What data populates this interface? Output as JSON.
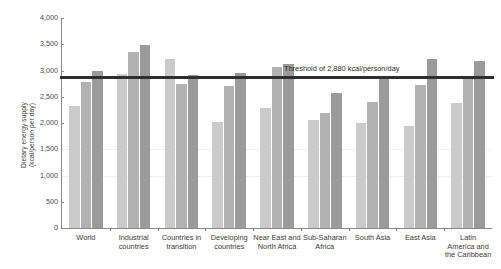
{
  "chart_data": {
    "type": "bar",
    "title": "",
    "xlabel": "",
    "ylabel_lines": [
      "Dietary energy supply",
      "(kcal/person per day)"
    ],
    "ylim": [
      0,
      4000
    ],
    "ytick_values": [
      0,
      500,
      1000,
      1500,
      2000,
      2500,
      3000,
      3500,
      4000
    ],
    "ytick_labels": [
      "0",
      "500",
      "1,000",
      "1,500",
      "2,000",
      "2,500",
      "3,000",
      "3,500",
      "4,000"
    ],
    "grid": false,
    "legend": "none",
    "categories": [
      "World",
      "Industrial countries",
      "Countries in transition",
      "Developing countries",
      "Near East and North Africa",
      "Sub-Saharan Africa",
      "South Asia",
      "East Asia",
      "Latin America and the Caribbean"
    ],
    "category_label_lines": [
      [
        "World"
      ],
      [
        "Industrial",
        "countries"
      ],
      [
        "Countries in",
        "transition"
      ],
      [
        "Developing",
        "countries"
      ],
      [
        "Near East and",
        "North Africa"
      ],
      [
        "Sub-Saharan",
        "Africa"
      ],
      [
        "South Asia"
      ],
      [
        "East Asia"
      ],
      [
        "Latin",
        "America and",
        "the Caribbean"
      ]
    ],
    "series": [
      {
        "name": "series-1",
        "color": "#cbcbcb",
        "values": [
          2330,
          2930,
          3220,
          2010,
          2290,
          2060,
          2000,
          1950,
          2380
        ]
      },
      {
        "name": "series-2",
        "color": "#b2b2b2",
        "values": [
          2780,
          3350,
          2750,
          2700,
          3060,
          2190,
          2400,
          2720,
          2830
        ]
      },
      {
        "name": "series-3",
        "color": "#9b9b9b",
        "values": [
          3000,
          3480,
          2920,
          2960,
          3130,
          2580,
          2880,
          3220,
          3180
        ]
      }
    ],
    "annotations": [
      {
        "name": "threshold",
        "text": "Threshold of 2,880 kcal/person/day",
        "value": 2880,
        "color": "#2f2f2f"
      }
    ]
  }
}
